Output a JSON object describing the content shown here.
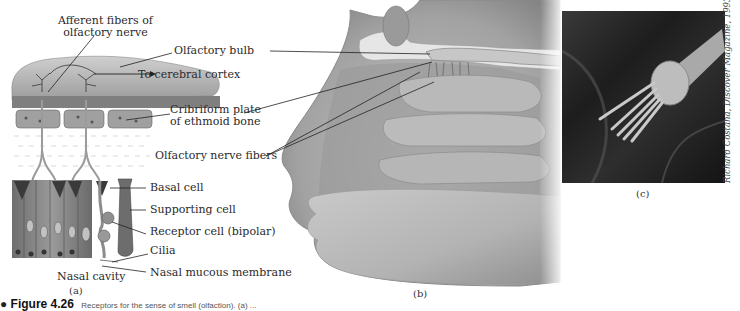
{
  "figure": {
    "number": "Figure 4.26",
    "title_fragment": "Receptors for the sense of smell (olfaction). (a) ...",
    "panels": {
      "a": {
        "caption": "(a)",
        "labels": {
          "afferent_fibers": "Afferent fibers of\nolfactory nerve",
          "afferent_line1": "Afferent fibers of",
          "afferent_line2": "olfactory nerve",
          "to_cortex": "To cerebral cortex",
          "nasal_cavity": "Nasal cavity"
        }
      },
      "shared_labels": {
        "olfactory_bulb": "Olfactory bulb",
        "cribriform_line1": "Cribriform plate",
        "cribriform_line2": "of ethmoid bone",
        "olfactory_nerve_fibers": "Olfactory nerve fibers",
        "basal_cell": "Basal cell",
        "supporting_cell": "Supporting cell",
        "receptor_cell": "Receptor cell (bipolar)",
        "cilia": "Cilia",
        "nasal_mucous_membrane": "Nasal mucous membrane"
      },
      "b": {
        "caption": "(b)"
      },
      "c": {
        "caption": "(c)",
        "credit": "Richard Costana, Discover Magazine, 1993"
      }
    }
  },
  "colors": {
    "bulb": "#b9b9b9",
    "tissue": "#8a8a8a",
    "cell_dark": "#4d4d4d",
    "head_light": "#d6d6d6",
    "head_mid": "#a8a8a8",
    "leader_line": "#222222"
  }
}
